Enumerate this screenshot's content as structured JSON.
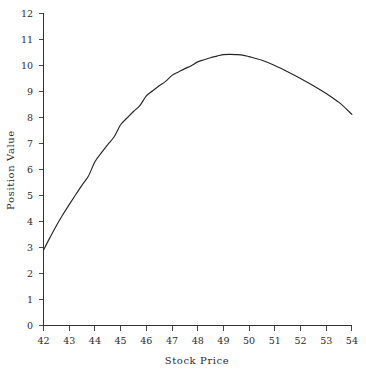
{
  "chart_data": {
    "type": "line",
    "title": "",
    "xlabel": "Stock Price",
    "ylabel": "Position Value",
    "xlim": [
      42,
      54
    ],
    "ylim": [
      0,
      12
    ],
    "xticks": [
      42,
      43,
      44,
      45,
      46,
      47,
      48,
      49,
      50,
      51,
      52,
      53,
      54
    ],
    "yticks": [
      0,
      1,
      2,
      3,
      4,
      5,
      6,
      7,
      8,
      9,
      10,
      11,
      12
    ],
    "xtick_labels": [
      "42",
      "43",
      "44",
      "45",
      "46",
      "47",
      "48",
      "49",
      "50",
      "51",
      "52",
      "53",
      "54"
    ],
    "ytick_labels": [
      "0",
      "1",
      "2",
      "3",
      "4",
      "5",
      "6",
      "7",
      "8",
      "9",
      "10",
      "11",
      "12"
    ],
    "grid": false,
    "legend": null,
    "line_color": "#262626",
    "series": [
      {
        "name": "Position Value",
        "x": [
          42.0,
          42.25,
          42.5,
          42.75,
          43.0,
          43.25,
          43.5,
          43.75,
          44.0,
          44.25,
          44.5,
          44.75,
          45.0,
          45.25,
          45.5,
          45.75,
          46.0,
          46.25,
          46.5,
          46.75,
          47.0,
          47.25,
          47.5,
          47.75,
          48.0,
          48.25,
          48.5,
          48.75,
          49.0,
          49.25,
          49.5,
          49.75,
          50.0,
          50.5,
          51.0,
          51.5,
          52.0,
          52.5,
          53.0,
          53.5,
          54.0
        ],
        "y": [
          2.9,
          3.38,
          3.84,
          4.26,
          4.65,
          5.03,
          5.4,
          5.75,
          6.3,
          6.64,
          6.96,
          7.26,
          7.72,
          7.98,
          8.23,
          8.46,
          8.83,
          9.03,
          9.22,
          9.39,
          9.62,
          9.75,
          9.88,
          9.99,
          10.14,
          10.22,
          10.3,
          10.36,
          10.42,
          10.43,
          10.42,
          10.4,
          10.34,
          10.2,
          10.0,
          9.76,
          9.5,
          9.22,
          8.92,
          8.58,
          8.12
        ]
      }
    ],
    "annotations": []
  },
  "axes": {
    "x_axis_title": "Stock Price",
    "y_axis_title": "Position Value"
  }
}
